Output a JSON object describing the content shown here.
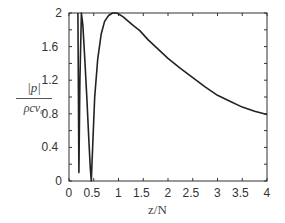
{
  "chart_data": {
    "type": "line",
    "title": "",
    "xlabel": "z/N",
    "ylabel": "|p| / ρcv₀",
    "ylabel_parts": {
      "numerator": "|p|",
      "denominator": "ρcv₀"
    },
    "xlim": [
      0,
      4
    ],
    "ylim": [
      0,
      2
    ],
    "xticks": [
      "0",
      "0.5",
      "1",
      "1.5",
      "2",
      "2.5",
      "3",
      "3.5",
      "4"
    ],
    "yticks": [
      "0",
      "0.4",
      "0.8",
      "1.2",
      "1.6",
      "2"
    ],
    "grid": false,
    "legend": null,
    "series": [
      {
        "name": "|p|/ρcv0",
        "color": "#222222",
        "x": [
          0.18,
          0.2,
          0.22,
          0.25,
          0.28,
          0.32,
          0.36,
          0.4,
          0.43,
          0.45,
          0.48,
          0.52,
          0.58,
          0.65,
          0.72,
          0.8,
          0.88,
          0.95,
          1.0,
          1.1,
          1.2,
          1.3,
          1.43,
          1.6,
          1.8,
          2.0,
          2.25,
          2.5,
          2.75,
          3.0,
          3.25,
          3.5,
          3.75,
          4.0
        ],
        "y": [
          2.0,
          0.1,
          1.2,
          2.0,
          1.85,
          1.45,
          1.0,
          0.5,
          0.15,
          0.0,
          0.45,
          1.0,
          1.45,
          1.75,
          1.9,
          1.97,
          2.0,
          2.0,
          1.99,
          1.95,
          1.9,
          1.85,
          1.79,
          1.68,
          1.57,
          1.46,
          1.34,
          1.23,
          1.12,
          1.02,
          0.95,
          0.88,
          0.83,
          0.79
        ]
      }
    ]
  }
}
